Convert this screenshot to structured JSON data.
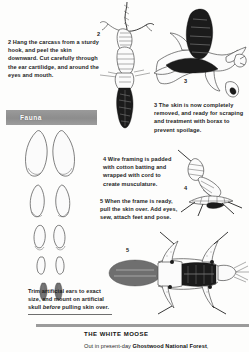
{
  "document": {
    "background_color": "#fdfdfc",
    "ink_color": "#1a1a1a"
  },
  "section_header": {
    "label": "Fauna",
    "bar_color": "#939393",
    "text_color": "#ffffff"
  },
  "steps": [
    {
      "number": "2",
      "text": "2 Hang the carcass from a sturdy hook, and peel the skin downward. Cut carefully through the ear cartilidge, and around the eyes and mouth.",
      "figure_label": "2",
      "figure_name": "hanging-carcass-figure"
    },
    {
      "number": "3",
      "text": "3 The skin is now completely removed, and ready for scraping and treatment with borax to prevent spoilage.",
      "figure_label": "3",
      "figure_name": "removed-skin-figure"
    },
    {
      "number": "4",
      "text": "4 Wire framing is padded with cotton batting and wrapped with cord to create musculature.",
      "figure_label": "4",
      "figure_name": "wire-frame-figure"
    },
    {
      "number": "5",
      "text": "5 When the frame is ready, pull the skin over. Add eyes, sew, attach feet and pose.",
      "figure_label": "5",
      "figure_name": "finished-mount-figure"
    }
  ],
  "ear_caption": {
    "lead": "Trim artificial ears to exact size, and mount on artificial skull ",
    "emphasis": "before",
    "tail": " pulling skin over."
  },
  "ear_diagram": {
    "name": "artificial-ear-templates",
    "pair_count": 5
  },
  "footer": {
    "title": "THE WHITE MOOSE",
    "body_lead": "Out in present-day ",
    "body_bold": "Ghostwood National Forest",
    "body_tail": ","
  }
}
